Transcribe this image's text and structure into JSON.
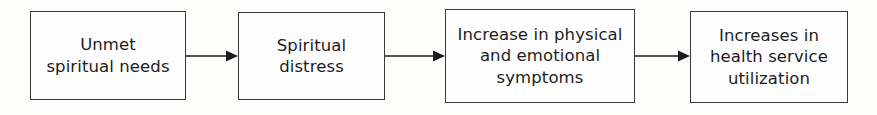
{
  "diagram": {
    "type": "linear-flowchart",
    "orientation": "left-to-right",
    "background_color": "#fdfdfb",
    "box_border_color": "#3a3a3a",
    "text_color": "#1c1c1c",
    "arrow_color": "#1c1c1c",
    "nodes": [
      {
        "id": "unmet-spiritual-needs",
        "label": "Unmet\nspiritual needs",
        "lines": [
          "Unmet",
          "spiritual needs"
        ],
        "order": 1
      },
      {
        "id": "spiritual-distress",
        "label": "Spiritual\ndistress",
        "lines": [
          "Spiritual",
          "distress"
        ],
        "order": 2
      },
      {
        "id": "increase-symptoms",
        "label": "Increase in physical\nand emotional\nsymptoms",
        "lines": [
          "Increase in physical",
          "and emotional",
          "symptoms"
        ],
        "order": 3
      },
      {
        "id": "increase-utilization",
        "label": "Increases in\nhealth service\nutilization",
        "lines": [
          "Increases in",
          "health service",
          "utilization"
        ],
        "order": 4
      }
    ],
    "connectors": [
      {
        "id": "connector-1",
        "from": "unmet-spiritual-needs",
        "to": "spiritual-distress",
        "style": "solid-arrow"
      },
      {
        "id": "connector-2",
        "from": "spiritual-distress",
        "to": "increase-symptoms",
        "style": "solid-arrow"
      },
      {
        "id": "connector-3",
        "from": "increase-symptoms",
        "to": "increase-utilization",
        "style": "solid-arrow"
      }
    ]
  }
}
